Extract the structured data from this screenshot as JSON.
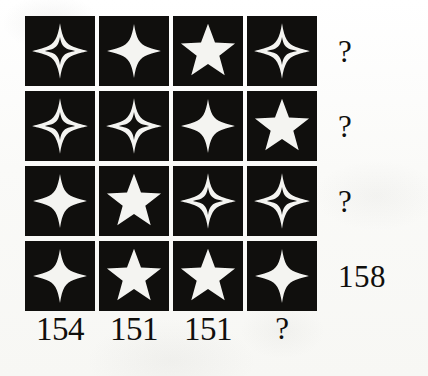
{
  "puzzle": {
    "kind": "star-grid-sum-puzzle",
    "background_color": "#fbfbfa",
    "tile_color": "#100f0d",
    "shape_color": "#f4f4f1",
    "rows": 4,
    "columns": 4,
    "cells": [
      [
        {
          "shape": "four-point-star-outline",
          "fill": "hollow",
          "points": 4
        },
        {
          "shape": "four-point-star-solid",
          "fill": "solid",
          "points": 4
        },
        {
          "shape": "five-point-star-solid",
          "fill": "solid",
          "points": 5
        },
        {
          "shape": "four-point-star-outline",
          "fill": "hollow",
          "points": 4
        }
      ],
      [
        {
          "shape": "four-point-star-outline",
          "fill": "hollow",
          "points": 4
        },
        {
          "shape": "four-point-star-outline",
          "fill": "hollow",
          "points": 4
        },
        {
          "shape": "four-point-star-solid",
          "fill": "solid",
          "points": 4
        },
        {
          "shape": "five-point-star-solid",
          "fill": "solid",
          "points": 5
        }
      ],
      [
        {
          "shape": "four-point-star-solid",
          "fill": "solid",
          "points": 4
        },
        {
          "shape": "five-point-star-solid",
          "fill": "solid",
          "points": 5
        },
        {
          "shape": "four-point-star-outline",
          "fill": "hollow",
          "points": 4
        },
        {
          "shape": "four-point-star-outline",
          "fill": "hollow",
          "points": 4
        }
      ],
      [
        {
          "shape": "four-point-star-solid",
          "fill": "solid",
          "points": 4
        },
        {
          "shape": "five-point-star-solid",
          "fill": "solid",
          "points": 5
        },
        {
          "shape": "five-point-star-solid",
          "fill": "solid",
          "points": 5
        },
        {
          "shape": "four-point-star-solid",
          "fill": "solid",
          "points": 4
        }
      ]
    ],
    "row_totals": [
      {
        "value": "?",
        "is_unknown": true
      },
      {
        "value": "?",
        "is_unknown": true
      },
      {
        "value": "?",
        "is_unknown": true
      },
      {
        "value": "158",
        "is_unknown": false
      }
    ],
    "column_totals": [
      {
        "value": "154",
        "is_unknown": false
      },
      {
        "value": "151",
        "is_unknown": false
      },
      {
        "value": "151",
        "is_unknown": false
      },
      {
        "value": "?",
        "is_unknown": true
      }
    ]
  }
}
